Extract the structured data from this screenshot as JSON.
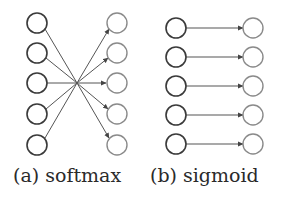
{
  "figure": {
    "panels": [
      {
        "id": "softmax",
        "caption": "(a) softmax",
        "connectivity": "fully-connected",
        "inputs": 5,
        "outputs": 5
      },
      {
        "id": "sigmoid",
        "caption": "(b) sigmoid",
        "connectivity": "one-to-one",
        "inputs": 5,
        "outputs": 5
      }
    ],
    "colors": {
      "input_node": "#3a3a3a",
      "output_node": "#8a8a8a",
      "edge": "#555555",
      "background": "#ffffff"
    }
  }
}
